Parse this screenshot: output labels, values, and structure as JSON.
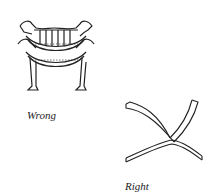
{
  "figures": [
    {
      "id": "ornate-chair",
      "caption": "Wrong"
    },
    {
      "id": "modern-chair",
      "caption": "Right"
    }
  ]
}
